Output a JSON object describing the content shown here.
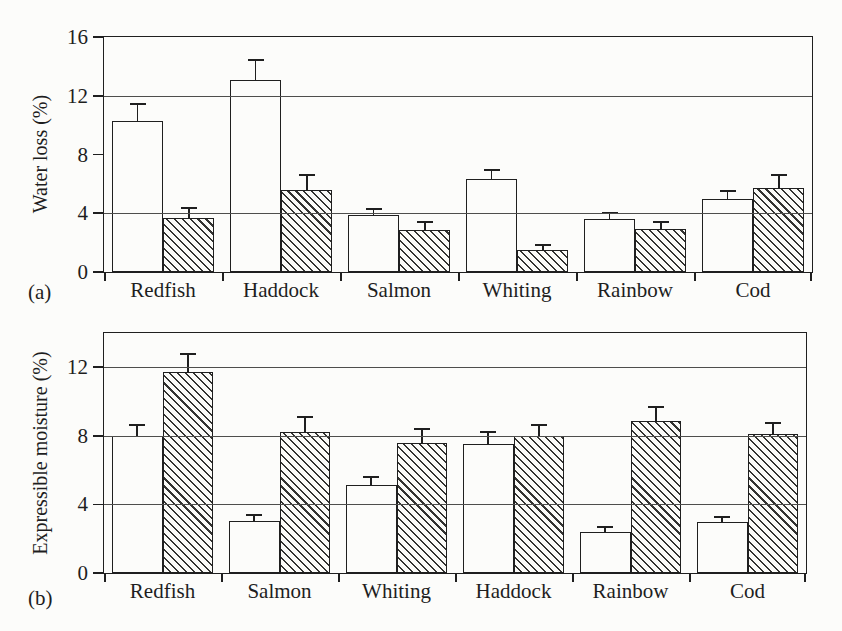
{
  "colors": {
    "background": "#fcfcfa",
    "ink": "#1f1f1f",
    "gridline": "#4e4e4c",
    "open_bar_fill": "#fcfcfa",
    "hatch_stroke": "#333331"
  },
  "chart_data": [
    {
      "type": "bar",
      "panel_label": "(a)",
      "title": "",
      "xlabel": "",
      "ylabel": "Water loss (%)",
      "categories": [
        "Redfish",
        "Haddock",
        "Salmon",
        "Whiting",
        "Rainbow",
        "Cod"
      ],
      "series": [
        {
          "name": "open bar",
          "fill": "open",
          "values": [
            10.3,
            13.1,
            3.85,
            6.3,
            3.6,
            4.95
          ],
          "errors_plus": [
            1.1,
            1.3,
            0.4,
            0.6,
            0.4,
            0.5
          ]
        },
        {
          "name": "hatched bar",
          "fill": "hatched",
          "values": [
            3.7,
            5.6,
            2.85,
            1.5,
            2.9,
            5.7
          ],
          "errors_plus": [
            0.6,
            1.0,
            0.5,
            0.3,
            0.5,
            0.9
          ]
        }
      ],
      "ylim": [
        0,
        16
      ],
      "yticks": [
        0,
        4,
        8,
        12,
        16
      ],
      "gridlines_at": [
        4,
        12
      ],
      "grid": "horizontal",
      "legend": "none",
      "error_bars": "upper caps only"
    },
    {
      "type": "bar",
      "panel_label": "(b)",
      "title": "",
      "xlabel": "",
      "ylabel": "Expressible moisture (%)",
      "categories": [
        "Redfish",
        "Salmon",
        "Whiting",
        "Haddock",
        "Rainbow",
        "Cod"
      ],
      "series": [
        {
          "name": "open bar",
          "fill": "open",
          "values": [
            8.0,
            3.05,
            5.15,
            7.55,
            2.4,
            3.0
          ],
          "errors_plus": [
            0.6,
            0.3,
            0.45,
            0.65,
            0.25,
            0.25
          ]
        },
        {
          "name": "hatched bar",
          "fill": "hatched",
          "values": [
            11.7,
            8.2,
            7.6,
            8.0,
            8.85,
            8.1
          ],
          "errors_plus": [
            1.05,
            0.85,
            0.75,
            0.6,
            0.8,
            0.65
          ]
        }
      ],
      "ylim": [
        0,
        14
      ],
      "yticks": [
        0,
        4,
        8,
        12
      ],
      "gridlines_at": [
        4,
        8,
        12
      ],
      "grid": "horizontal",
      "legend": "none",
      "error_bars": "upper caps only"
    }
  ]
}
